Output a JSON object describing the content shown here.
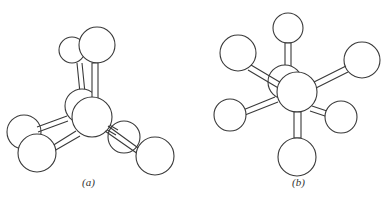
{
  "figure": {
    "panels": [
      {
        "id": "a",
        "label": "(a)",
        "description": "tetrahedral ball-and-stick model"
      },
      {
        "id": "b",
        "label": "(b)",
        "description": "octahedral ball-and-stick model"
      }
    ],
    "colors": {
      "stroke": "#3a3a3a",
      "fill": "#ffffff"
    }
  }
}
